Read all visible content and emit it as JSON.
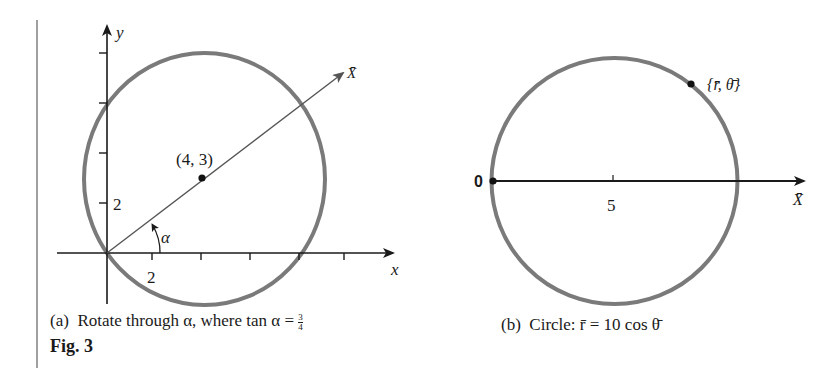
{
  "figure": {
    "label": "Fig. 3",
    "panel_a": {
      "caption_prefix": "(a)",
      "caption_text": "Rotate through α, where tan α =",
      "caption_frac_num": "3",
      "caption_frac_den": "4",
      "y_axis_label": "y",
      "x_axis_label": "x",
      "rotated_axis_label": "X̄",
      "center_point_label": "(4, 3)",
      "angle_label": "α",
      "x_tick_label": "2",
      "y_tick_label": "2",
      "x_ticks": [
        2,
        4,
        6,
        8,
        10
      ],
      "y_ticks": [
        2,
        4,
        6,
        8
      ],
      "circle": {
        "center": [
          4,
          3
        ],
        "radius": 5
      }
    },
    "panel_b": {
      "caption_prefix": "(b)",
      "caption_text": "Circle: r̄ = 10 cos θ̄",
      "origin_label": "0",
      "axis_label": "X̄",
      "tick_label": "5",
      "point_label": "{r̄, θ̄}",
      "circle": {
        "center": [
          5,
          0
        ],
        "radius": 5
      }
    },
    "colors": {
      "circle": "#7a7a7a",
      "axes": "#1a1a1a",
      "rotated_axis": "#555555",
      "rule": "#888888"
    }
  }
}
